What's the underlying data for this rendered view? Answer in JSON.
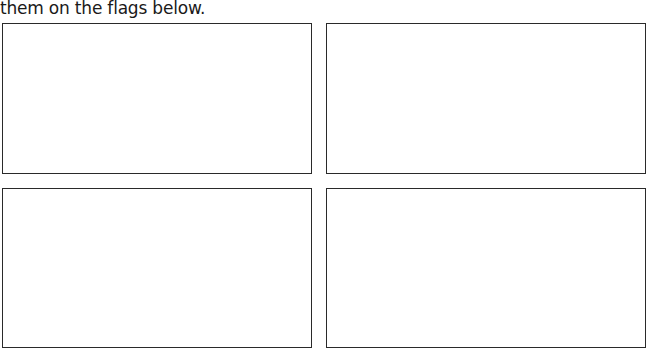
{
  "instruction": {
    "text": "them on the flags below."
  },
  "flags": [
    {
      "id": "flag-1",
      "position": "top-left",
      "content": ""
    },
    {
      "id": "flag-2",
      "position": "top-right",
      "content": ""
    },
    {
      "id": "flag-3",
      "position": "bottom-left",
      "content": ""
    },
    {
      "id": "flag-4",
      "position": "bottom-right",
      "content": ""
    }
  ],
  "colors": {
    "border": "#2a2a2a",
    "background": "#ffffff",
    "text": "#1a1a1a"
  }
}
